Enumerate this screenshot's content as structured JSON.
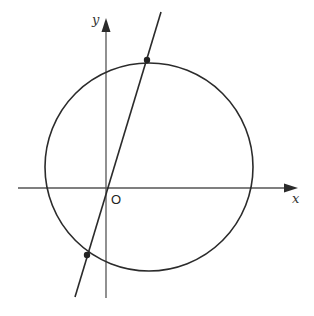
{
  "diagram": {
    "type": "coordinate-geometry",
    "axes": {
      "x_label": "x",
      "y_label": "y",
      "origin_label": "O"
    },
    "elements": {
      "circle": {
        "description": "circle intersecting both axes, center in first quadrant near origin"
      },
      "line": {
        "description": "line through origin O with positive slope"
      },
      "points": [
        {
          "description": "upper intersection of line and circle"
        },
        {
          "description": "lower intersection of line and circle"
        }
      ]
    },
    "colors": {
      "stroke": "#2b2b2b",
      "axis": "#555555",
      "background": "#ffffff"
    }
  }
}
